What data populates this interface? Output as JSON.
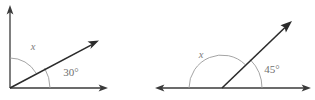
{
  "figure": {
    "background_color": "#ffffff",
    "line_color": "#2b2b2b",
    "arc_color": "#9a9a9a",
    "label_color": "#6f6f6f",
    "width": 315,
    "height": 100
  },
  "diagrams": [
    {
      "id": "left-angle-diagram",
      "description": "Right angle split by a ray into x and 30 degrees",
      "vertex": {
        "x": 10,
        "y": 88
      },
      "rays": [
        {
          "name": "vertical-ray",
          "angle_deg": 90,
          "tip": {
            "x": 10,
            "y": 8
          },
          "has_arrow": true
        },
        {
          "name": "diagonal-ray",
          "angle_deg": 30,
          "tip": {
            "x": 99,
            "y": 40
          },
          "has_arrow": true
        },
        {
          "name": "horizontal-ray",
          "angle_deg": 0,
          "tip": {
            "x": 108,
            "y": 88
          },
          "has_arrow": true
        }
      ],
      "unknown_label": "x",
      "known_label": "30°",
      "known_value": 30,
      "unknown_value": 60,
      "arcs": [
        {
          "name": "x-arc",
          "radius": 30,
          "start_deg": 30,
          "end_deg": 90
        },
        {
          "name": "known-arc",
          "radius": 40,
          "start_deg": 0,
          "end_deg": 30
        }
      ]
    },
    {
      "id": "right-angle-diagram",
      "description": "Straight line split by a ray into x and 45 degrees",
      "vertex": {
        "x": 222,
        "y": 88
      },
      "rays": [
        {
          "name": "left-ray",
          "angle_deg": 180,
          "tip": {
            "x": 155,
            "y": 88
          },
          "has_arrow": true
        },
        {
          "name": "diagonal-ray",
          "angle_deg": 45,
          "tip": {
            "x": 292,
            "y": 21
          },
          "has_arrow": true
        },
        {
          "name": "right-ray",
          "angle_deg": 0,
          "tip": {
            "x": 311,
            "y": 88
          },
          "has_arrow": true
        }
      ],
      "unknown_label": "x",
      "known_label": "45°",
      "known_value": 45,
      "unknown_value": 135,
      "arcs": [
        {
          "name": "x-arc",
          "radius": 33,
          "start_deg": 45,
          "end_deg": 180
        },
        {
          "name": "known-arc",
          "radius": 40,
          "start_deg": 0,
          "end_deg": 45
        }
      ]
    }
  ],
  "labels": {
    "left_x": "x",
    "left_angle": "30°",
    "right_x": "x",
    "right_angle": "45°"
  }
}
